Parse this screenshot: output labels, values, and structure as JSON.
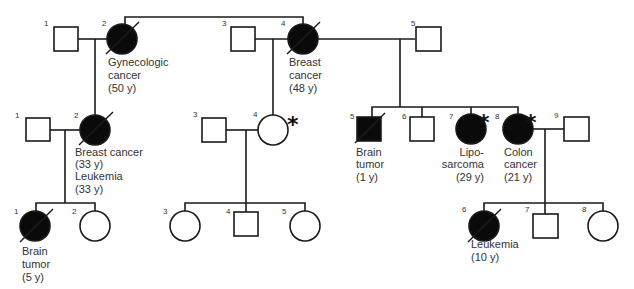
{
  "legend": {
    "filled": "affected",
    "slash": "deceased",
    "asterisk": "marked individual"
  },
  "generations": [
    {
      "gen": "I",
      "individuals": [
        {
          "id": "1",
          "sex": "male",
          "affected": false,
          "deceased": false,
          "label": []
        },
        {
          "id": "2",
          "sex": "female",
          "affected": true,
          "deceased": true,
          "label": [
            "Gynecologic",
            "cancer",
            "(50 y)"
          ]
        },
        {
          "id": "3",
          "sex": "male",
          "affected": false,
          "deceased": false,
          "label": []
        },
        {
          "id": "4",
          "sex": "female",
          "affected": true,
          "deceased": true,
          "label": [
            "Breast",
            "cancer",
            "(48 y)"
          ]
        },
        {
          "id": "5",
          "sex": "male",
          "affected": false,
          "deceased": false,
          "label": []
        }
      ]
    },
    {
      "gen": "II",
      "individuals": [
        {
          "id": "1",
          "sex": "male",
          "affected": false,
          "deceased": false,
          "label": []
        },
        {
          "id": "2",
          "sex": "female",
          "affected": true,
          "deceased": true,
          "label": [
            "Breast cancer",
            "(33 y)",
            "Leukemia",
            "(33 y)"
          ]
        },
        {
          "id": "3",
          "sex": "male",
          "affected": false,
          "deceased": false,
          "label": []
        },
        {
          "id": "4",
          "sex": "female",
          "affected": false,
          "deceased": false,
          "asterisk": true,
          "label": []
        },
        {
          "id": "5",
          "sex": "male",
          "affected": true,
          "deceased": true,
          "label": [
            "Brain",
            "tumor",
            "(1 y)"
          ]
        },
        {
          "id": "6",
          "sex": "male",
          "affected": false,
          "deceased": false,
          "label": []
        },
        {
          "id": "7",
          "sex": "female",
          "affected": true,
          "deceased": false,
          "asterisk": true,
          "label": [
            "Lipo-",
            "sarcoma",
            "(29 y)"
          ]
        },
        {
          "id": "8",
          "sex": "female",
          "affected": true,
          "deceased": false,
          "asterisk": true,
          "label": [
            "Colon",
            "cancer",
            "(21 y)"
          ]
        },
        {
          "id": "9",
          "sex": "male",
          "affected": false,
          "deceased": false,
          "label": []
        }
      ]
    },
    {
      "gen": "III",
      "individuals": [
        {
          "id": "1",
          "sex": "female",
          "affected": true,
          "deceased": true,
          "label": [
            "Brain",
            "tumor",
            "(5 y)"
          ]
        },
        {
          "id": "2",
          "sex": "female",
          "affected": false,
          "deceased": false,
          "label": []
        },
        {
          "id": "3",
          "sex": "female",
          "affected": false,
          "deceased": false,
          "label": []
        },
        {
          "id": "4",
          "sex": "male",
          "affected": false,
          "deceased": false,
          "label": []
        },
        {
          "id": "5",
          "sex": "female",
          "affected": false,
          "deceased": false,
          "label": []
        },
        {
          "id": "6",
          "sex": "female",
          "affected": true,
          "deceased": true,
          "label": [
            "Leukemia",
            "(10 y)"
          ]
        },
        {
          "id": "7",
          "sex": "male",
          "affected": false,
          "deceased": false,
          "label": []
        },
        {
          "id": "8",
          "sex": "female",
          "affected": false,
          "deceased": false,
          "label": []
        }
      ]
    }
  ],
  "symbols": {
    "asterisk": "*"
  }
}
